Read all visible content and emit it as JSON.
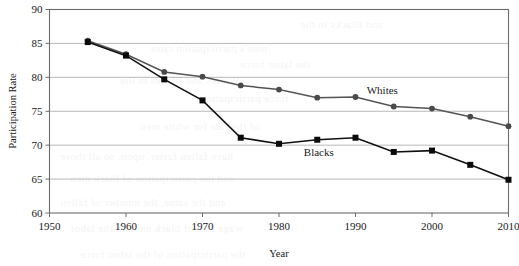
{
  "chart_data": {
    "type": "line",
    "title": "",
    "xlabel": "Year",
    "ylabel": "Participation Rate",
    "xlim": [
      1950,
      2010
    ],
    "ylim": [
      60,
      90
    ],
    "xticks": [
      1950,
      1960,
      1970,
      1980,
      1990,
      2000,
      2010
    ],
    "xtick_labels": [
      "1950",
      "1960",
      "1970",
      "1980",
      "1990",
      "2000",
      "2010"
    ],
    "yticks": [
      60,
      65,
      70,
      75,
      80,
      85,
      90
    ],
    "ytick_labels": [
      "60",
      "65",
      "70",
      "75",
      "80",
      "85",
      "90"
    ],
    "grid": "horizontal",
    "legend_position": "inline-annotation",
    "x": [
      1955,
      1960,
      1965,
      1970,
      1975,
      1980,
      1985,
      1990,
      1995,
      2000,
      2005,
      2010
    ],
    "series": [
      {
        "name": "Whites",
        "color": "#4a4a4a",
        "marker": "circle",
        "label_x": 1993.5,
        "label_y": 77.6,
        "values": [
          85.4,
          83.4,
          80.8,
          80.1,
          78.8,
          78.2,
          77.0,
          77.1,
          75.7,
          75.4,
          74.2,
          72.8
        ]
      },
      {
        "name": "Blacks",
        "color": "#0b0b0b",
        "marker": "square",
        "label_x": 1985.2,
        "label_y": 68.4,
        "values": [
          85.2,
          83.2,
          79.7,
          76.6,
          71.1,
          70.2,
          70.8,
          71.1,
          69.0,
          69.2,
          67.1,
          64.9
        ]
      }
    ]
  },
  "bleed_through": {
    "lines": [
      {
        "text": "and Blacks in the",
        "x": 300,
        "y": 18
      },
      {
        "text": "men's participation rates",
        "x": 150,
        "y": 42
      },
      {
        "text": "the labor force",
        "x": 240,
        "y": 58
      },
      {
        "text": "Whites and Blacks in the",
        "x": 120,
        "y": 74
      },
      {
        "text": "force participation",
        "x": 200,
        "y": 92
      },
      {
        "text": "of the rate for white men",
        "x": 140,
        "y": 120
      },
      {
        "text": "have fallen faster, upon, so all those",
        "x": 60,
        "y": 150
      },
      {
        "text": "and the participation of black men",
        "x": 70,
        "y": 172
      },
      {
        "text": "and the same, the number of fallen",
        "x": 60,
        "y": 196
      },
      {
        "text": "wage rate of black men, in the labor",
        "x": 70,
        "y": 222
      },
      {
        "text": "the participation of the labor force",
        "x": 80,
        "y": 248
      }
    ]
  }
}
